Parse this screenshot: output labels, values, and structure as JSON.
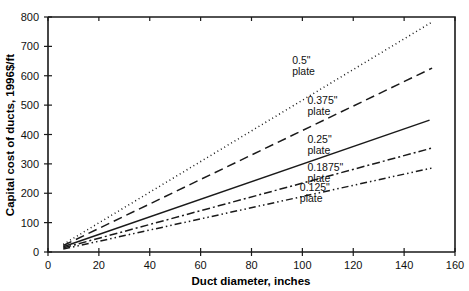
{
  "chart_data": {
    "type": "line",
    "title": "",
    "xlabel": "Duct diameter, inches",
    "ylabel": "Capital cost of ducts, 1996$/ft",
    "xlim": [
      0,
      160
    ],
    "ylim": [
      0,
      800
    ],
    "xticks": [
      0,
      20,
      40,
      60,
      80,
      100,
      120,
      140,
      160
    ],
    "yticks": [
      0,
      100,
      200,
      300,
      400,
      500,
      600,
      700,
      800
    ],
    "grid": false,
    "legend_position": "inline-right",
    "series": [
      {
        "name": "0.5\" plate",
        "label_lines": [
          "0.5\"",
          "plate"
        ],
        "style": "dotted",
        "dash": "1,3",
        "x": [
          6,
          151
        ],
        "y": [
          26,
          783
        ],
        "label_x": 96,
        "label_y": 640
      },
      {
        "name": "0.375\" plate",
        "label_lines": [
          "0.375\"",
          "plate"
        ],
        "style": "dashed",
        "dash": "9,5",
        "x": [
          6,
          151
        ],
        "y": [
          22,
          626
        ],
        "label_x": 102,
        "label_y": 505
      },
      {
        "name": "0.25\" plate",
        "label_lines": [
          "0.25\"",
          "plate"
        ],
        "style": "solid",
        "dash": "none",
        "x": [
          6,
          150
        ],
        "y": [
          18,
          449
        ],
        "label_x": 102,
        "label_y": 372
      },
      {
        "name": "0.1875\" plate",
        "label_lines": [
          "0.1875\"",
          "plate"
        ],
        "style": "dash-dot",
        "dash": "8,3,2,3",
        "x": [
          6,
          151
        ],
        "y": [
          14,
          354
        ],
        "label_x": 102,
        "label_y": 277
      },
      {
        "name": "0.125\" plate",
        "label_lines": [
          "0.125\"",
          "plate"
        ],
        "style": "dash-dot-dot",
        "dash": "7,3,1.5,3,1.5,3",
        "x": [
          6,
          151
        ],
        "y": [
          10,
          286
        ],
        "label_x": 99,
        "label_y": 207
      }
    ]
  }
}
